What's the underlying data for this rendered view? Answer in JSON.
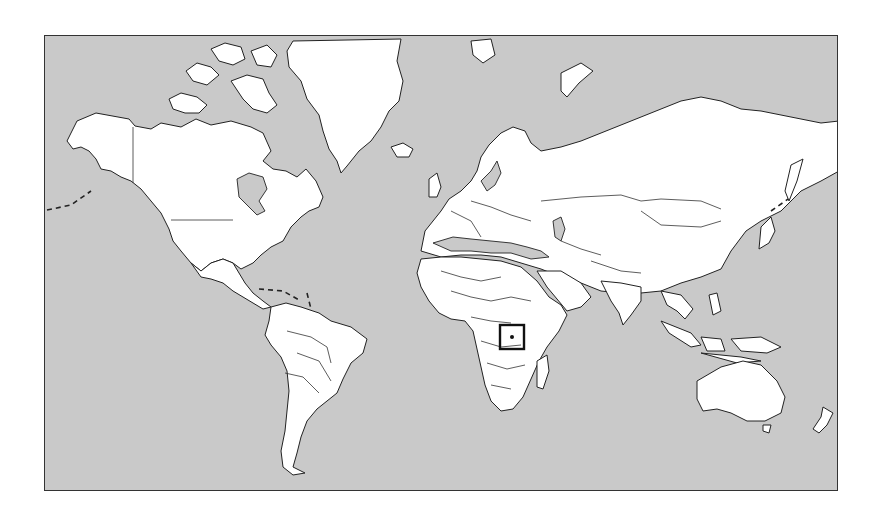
{
  "map": {
    "type": "world-political-outline",
    "projection": "mercator",
    "colors": {
      "ocean": "#c9c9c9",
      "land": "#ffffff",
      "outline": "#222222"
    },
    "highlight": {
      "label": "",
      "region": "East Africa (Uganda / Rwanda area)",
      "box": {
        "x": 499,
        "y": 324,
        "width": 24,
        "height": 24
      }
    }
  }
}
